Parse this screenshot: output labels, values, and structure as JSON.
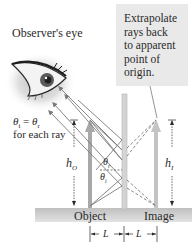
{
  "labels": {
    "observer": "Observer's eye",
    "callout_lines": [
      "Extrapolate",
      "rays back",
      "to apparent",
      "point of",
      "origin."
    ],
    "law_line1": "θi = θr",
    "law_theta_i": "θ",
    "law_sub_i": "i",
    "law_equals": " = ",
    "law_theta_r": "θ",
    "law_sub_r": "r",
    "law_line2": "for each ray",
    "object": "Object",
    "image": "Image",
    "h_object": "h",
    "h_object_sub": "O",
    "h_image": "h",
    "h_image_sub": "I",
    "theta_r": "θ",
    "theta_r_sub": "r",
    "theta_i": "θ",
    "theta_i_sub": "i",
    "L1": "L",
    "L2": "L"
  },
  "colors": {
    "callout_bg": "#e9e9e9",
    "floor": "#c8c8c8",
    "mirror": "#d4d4d4",
    "arrow": "#a8a8a8",
    "ray": "#7a7a7a",
    "text": "#2a2a2a"
  }
}
